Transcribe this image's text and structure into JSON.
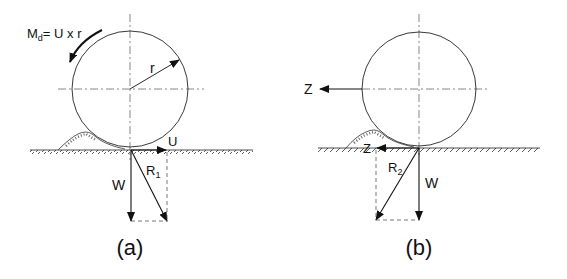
{
  "figure": {
    "panel_a": {
      "caption": "(a)",
      "moment_label": "M",
      "moment_sub": "d",
      "moment_eq": "= U x r",
      "radius_label": "r",
      "force_u": "U",
      "force_w": "W",
      "resultant": "R",
      "resultant_sub": "1"
    },
    "panel_b": {
      "caption": "(b)",
      "force_z_top": "Z",
      "force_z_ground": "Z",
      "force_w": "W",
      "resultant": "R",
      "resultant_sub": "2"
    },
    "colors": {
      "ink": "#111111",
      "background": "#ffffff"
    }
  }
}
